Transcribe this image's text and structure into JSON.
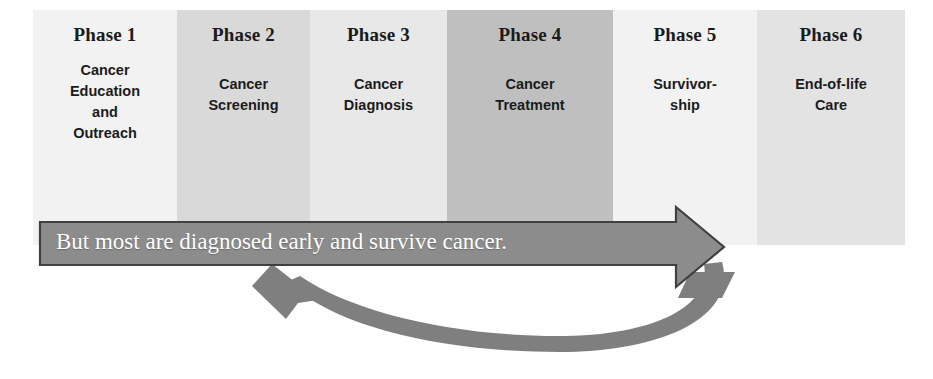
{
  "diagram": {
    "title_hidden": "",
    "phases": [
      {
        "title": "Phase 1",
        "body": "Cancer\nEducation\nand\nOutreach",
        "fill": "#f2f2f2",
        "x": 33,
        "width": 144,
        "body_lines": [
          "Cancer",
          "Education",
          "and",
          "Outreach"
        ]
      },
      {
        "title": "Phase 2",
        "body": "Cancer\nScreening",
        "fill": "#d9d9d9",
        "x": 177,
        "width": 133,
        "body_lines": [
          "Cancer",
          "Screening"
        ]
      },
      {
        "title": "Phase 3",
        "body": "Cancer\nDiagnosis",
        "fill": "#e8e8e8",
        "x": 310,
        "width": 137,
        "body_lines": [
          "Cancer",
          "Diagnosis"
        ]
      },
      {
        "title": "Phase 4",
        "body": "Cancer\nTreatment",
        "fill": "#bfbfbf",
        "x": 447,
        "width": 166,
        "body_lines": [
          "Cancer",
          "Treatment"
        ]
      },
      {
        "title": "Phase 5",
        "body": "Survivor-\nship",
        "fill": "#f2f2f2",
        "x": 613,
        "width": 144,
        "body_lines": [
          "Survivor-",
          "ship"
        ]
      },
      {
        "title": "Phase 6",
        "body": "End-of-life\nCare",
        "fill": "#e3e3e3",
        "x": 757,
        "width": 148,
        "body_lines": [
          "End-of-life",
          "Care"
        ]
      }
    ],
    "banner": {
      "text": "But most are diagnosed early and survive cancer.",
      "fill": "#8c8c8c",
      "stroke": "#3f3f3f",
      "text_color": "#ffffff"
    },
    "return_arrow": {
      "label": "return-loop-arrow",
      "fill": "#7f7f7f",
      "direction": "right-to-left"
    },
    "colors": {
      "banner_fill": "#8c8c8c",
      "banner_stroke": "#404040",
      "loop_fill": "#7f7f7f",
      "text_dark": "#1b1b1b"
    }
  }
}
